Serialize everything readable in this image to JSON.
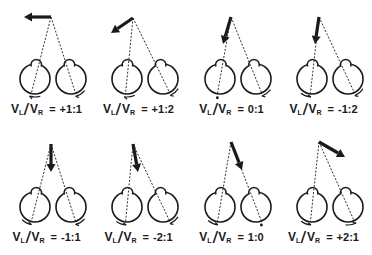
{
  "figure": {
    "colors": {
      "ink": "#1a1a1a",
      "background": "#ffffff"
    },
    "label_template": {
      "v": "V",
      "left_sub": "L",
      "right_sub": "R",
      "equals": "="
    },
    "panels": [
      {
        "id": 1,
        "ratio": "+1:1",
        "arrow_direction": "left",
        "fixation": [
          51,
          17
        ],
        "arrow_tip": [
          24,
          17
        ],
        "left_eye_rotation": "ccw",
        "right_eye_rotation": "ccw",
        "left_dot": false,
        "right_dot": false
      },
      {
        "id": 2,
        "ratio": "+1:2",
        "arrow_direction": "down-left",
        "fixation": [
          41,
          18
        ],
        "arrow_tip": [
          19,
          33
        ],
        "left_eye_rotation": "ccw",
        "right_eye_rotation": "ccw",
        "left_dot": false,
        "right_dot": false
      },
      {
        "id": 3,
        "ratio": "0:1",
        "arrow_direction": "down-slightly-left",
        "fixation": [
          46,
          17
        ],
        "arrow_tip": [
          38,
          44
        ],
        "left_eye_rotation": "none",
        "right_eye_rotation": "ccw",
        "left_dot": true,
        "right_dot": false
      },
      {
        "id": 4,
        "ratio": "-1:2",
        "arrow_direction": "down",
        "fixation": [
          42,
          17
        ],
        "arrow_tip": [
          38,
          44
        ],
        "left_eye_rotation": "cw",
        "right_eye_rotation": "ccw",
        "left_dot": false,
        "right_dot": false
      },
      {
        "id": 5,
        "ratio": "-1:1",
        "arrow_direction": "down",
        "fixation": [
          51,
          16
        ],
        "arrow_tip": [
          51,
          44
        ],
        "left_eye_rotation": "cw",
        "right_eye_rotation": "ccw",
        "left_dot": false,
        "right_dot": false
      },
      {
        "id": 6,
        "ratio": "-2:1",
        "arrow_direction": "down-slightly-right",
        "fixation": [
          41,
          16
        ],
        "arrow_tip": [
          46,
          44
        ],
        "left_eye_rotation": "cw",
        "right_eye_rotation": "ccw",
        "left_dot": false,
        "right_dot": false
      },
      {
        "id": 7,
        "ratio": "1:0",
        "arrow_direction": "down-right",
        "fixation": [
          46,
          14
        ],
        "arrow_tip": [
          57,
          42
        ],
        "left_eye_rotation": "cw",
        "right_eye_rotation": "none",
        "left_dot": false,
        "right_dot": true
      },
      {
        "id": 8,
        "ratio": "+2:1",
        "arrow_direction": "right-down",
        "fixation": [
          42,
          14
        ],
        "arrow_tip": [
          68,
          29
        ],
        "left_eye_rotation": "cw",
        "right_eye_rotation": "cw",
        "left_dot": false,
        "right_dot": false
      }
    ]
  }
}
